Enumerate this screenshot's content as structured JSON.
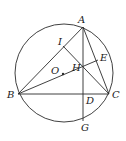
{
  "diagram": {
    "type": "geometry",
    "circle": {
      "center": "O",
      "cx": 64,
      "cy": 73,
      "r": 49
    },
    "points": {
      "A": {
        "x": 83,
        "y": 27,
        "label": "A",
        "lx": 78,
        "ly": 23
      },
      "B": {
        "x": 18,
        "y": 94,
        "label": "B",
        "lx": 7,
        "ly": 98
      },
      "C": {
        "x": 109,
        "y": 94,
        "label": "C",
        "lx": 112,
        "ly": 98
      },
      "D": {
        "x": 83,
        "y": 94,
        "label": "D",
        "lx": 86,
        "ly": 104
      },
      "E": {
        "x": 98,
        "y": 60,
        "label": "E",
        "lx": 100,
        "ly": 61
      },
      "G": {
        "x": 83,
        "y": 121,
        "label": "G",
        "lx": 81,
        "ly": 131
      },
      "H": {
        "x": 83,
        "y": 67,
        "label": "H",
        "lx": 72,
        "ly": 71
      },
      "I": {
        "x": 63,
        "y": 46,
        "label": "I",
        "lx": 58,
        "ly": 45
      },
      "O": {
        "x": 63,
        "y": 74,
        "label": "O",
        "lx": 51,
        "ly": 74
      }
    },
    "segments": [
      [
        "A",
        "B"
      ],
      [
        "A",
        "C"
      ],
      [
        "B",
        "C"
      ],
      [
        "A",
        "G"
      ],
      [
        "B",
        "E"
      ],
      [
        "I",
        "C"
      ]
    ],
    "stroke_color": "#2b2b2b"
  }
}
